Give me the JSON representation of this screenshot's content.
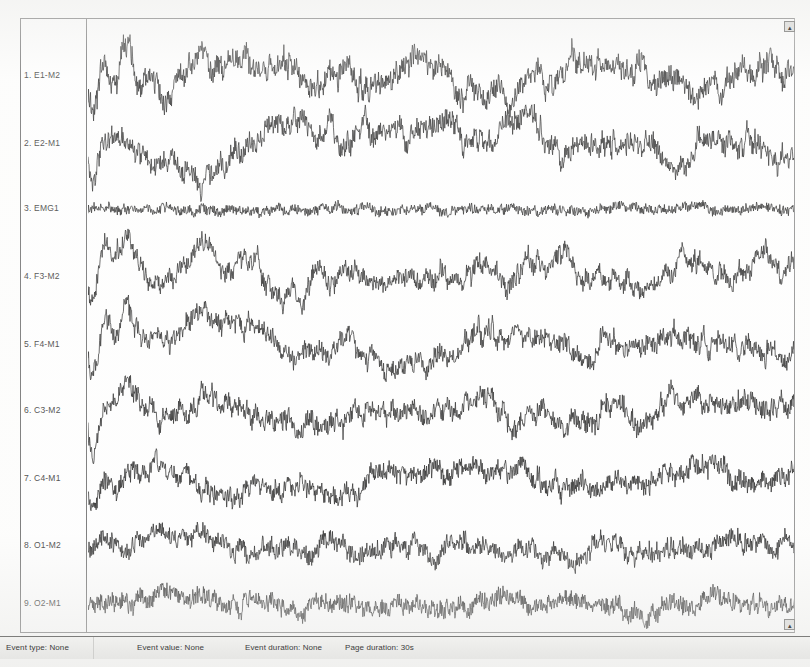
{
  "app": {
    "name": "polysomnography-viewer",
    "background_color": "#fdfdfc",
    "frame_color": "#6f6f6f",
    "trace_color": "#1a1a1a"
  },
  "channels": [
    {
      "index": "1",
      "label": "1. E1-M2",
      "name": "E1-M2",
      "type": "EOG"
    },
    {
      "index": "2",
      "label": "2. E2-M1",
      "name": "E2-M1",
      "type": "EOG"
    },
    {
      "index": "3",
      "label": "3. EMG1",
      "name": "EMG1",
      "type": "EMG"
    },
    {
      "index": "4",
      "label": "4. F3-M2",
      "name": "F3-M2",
      "type": "EEG"
    },
    {
      "index": "5",
      "label": "5. F4-M1",
      "name": "F4-M1",
      "type": "EEG"
    },
    {
      "index": "6",
      "label": "6. C3-M2",
      "name": "C3-M2",
      "type": "EEG"
    },
    {
      "index": "7",
      "label": "7. C4-M1",
      "name": "C4-M1",
      "type": "EEG"
    },
    {
      "index": "8",
      "label": "8. O1-M2",
      "name": "O1-M2",
      "type": "EEG"
    },
    {
      "index": "9",
      "label": "9. O2-M1",
      "name": "O2-M1",
      "type": "EEG"
    }
  ],
  "status_bar": {
    "event_type": "Event type: None",
    "event_value": "Event value: None",
    "event_duration": "Event duration: None",
    "page_duration": "Page duration: 30s"
  },
  "controls": {
    "scroll_up_glyph": "▴",
    "scroll_down_glyph": "▴"
  },
  "chart_data": {
    "type": "line",
    "title": "",
    "xlabel": "",
    "ylabel": "",
    "legend": "none",
    "grid": false,
    "x_range_seconds": [
      0,
      30
    ],
    "page_duration_seconds": 30,
    "sampling_note": "9 stacked biosignal traces over one 30-second epoch",
    "series": [
      {
        "name": "E1-M2",
        "baseline_y": 57,
        "amplitude": 26,
        "roughness": 0.55,
        "seed": 11,
        "drift": [
          0,
          -6,
          4,
          -18,
          -22,
          -10,
          -4,
          2,
          0,
          -2,
          1,
          3,
          0,
          -2,
          -1,
          2,
          0,
          -1,
          1,
          0
        ],
        "onset_burst": true
      },
      {
        "name": "E2-M1",
        "baseline_y": 125,
        "amplitude": 24,
        "roughness": 0.55,
        "seed": 23,
        "drift": [
          0,
          12,
          20,
          26,
          8,
          -6,
          -2,
          1,
          0,
          2,
          -1,
          0,
          1,
          -2,
          0,
          1,
          2,
          0,
          -1,
          0
        ],
        "onset_burst": true
      },
      {
        "name": "EMG1",
        "baseline_y": 190,
        "amplitude": 7,
        "roughness": 0.96,
        "seed": 37,
        "drift": [
          0,
          0,
          0,
          0,
          0,
          0,
          0,
          0,
          0,
          0,
          0,
          0,
          0,
          0,
          0,
          0,
          0,
          0,
          0,
          0
        ],
        "onset_burst": false
      },
      {
        "name": "F3-M2",
        "baseline_y": 258,
        "amplitude": 22,
        "roughness": 0.5,
        "seed": 41,
        "drift": [
          0,
          -24,
          -8,
          -26,
          -14,
          6,
          14,
          10,
          4,
          0,
          -3,
          2,
          1,
          -2,
          3,
          0,
          -1,
          2,
          0,
          1
        ],
        "onset_burst": true
      },
      {
        "name": "F4-M1",
        "baseline_y": 326,
        "amplitude": 22,
        "roughness": 0.5,
        "seed": 53,
        "drift": [
          0,
          -22,
          -6,
          -24,
          -12,
          6,
          13,
          9,
          3,
          0,
          -2,
          2,
          0,
          -2,
          3,
          0,
          -1,
          1,
          0,
          1
        ],
        "onset_burst": true
      },
      {
        "name": "C3-M2",
        "baseline_y": 392,
        "amplitude": 20,
        "roughness": 0.62,
        "seed": 67,
        "drift": [
          0,
          -16,
          -4,
          -14,
          -6,
          4,
          8,
          5,
          2,
          0,
          -2,
          1,
          0,
          -1,
          2,
          0,
          -1,
          1,
          0,
          0
        ],
        "onset_burst": true
      },
      {
        "name": "C4-M1",
        "baseline_y": 460,
        "amplitude": 19,
        "roughness": 0.62,
        "seed": 79,
        "drift": [
          0,
          6,
          -10,
          -2,
          6,
          8,
          4,
          0,
          -2,
          1,
          0,
          -1,
          2,
          0,
          -1,
          1,
          0,
          -2,
          1,
          0
        ],
        "onset_burst": true
      },
      {
        "name": "O1-M2",
        "baseline_y": 527,
        "amplitude": 17,
        "roughness": 0.7,
        "seed": 89,
        "drift": [
          0,
          -4,
          -8,
          -4,
          2,
          4,
          2,
          0,
          -1,
          1,
          0,
          -2,
          1,
          0,
          -1,
          2,
          0,
          -1,
          0,
          1
        ],
        "onset_burst": false
      },
      {
        "name": "O2-M1",
        "baseline_y": 585,
        "amplitude": 16,
        "roughness": 0.72,
        "seed": 97,
        "drift": [
          0,
          -2,
          -5,
          -2,
          2,
          3,
          1,
          0,
          -1,
          1,
          0,
          -1,
          1,
          0,
          -1,
          1,
          0,
          -1,
          0,
          1
        ],
        "onset_burst": false
      }
    ]
  }
}
